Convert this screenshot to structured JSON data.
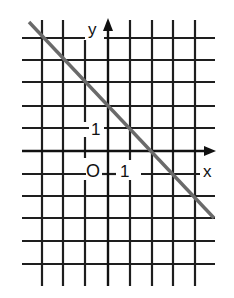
{
  "diagram": {
    "type": "coordinate-plane",
    "labels": {
      "x_axis": "x",
      "y_axis": "y",
      "origin": "O",
      "x_unit": "1",
      "y_unit": "1"
    },
    "grid": {
      "columns": 8,
      "rows": 11,
      "unit_px": 22
    },
    "line": {
      "equation": "y = -x + 2",
      "slope": -1,
      "y_intercept": 2,
      "x_intercept": 2,
      "color": "#6a6a6a"
    },
    "colors": {
      "grid": "#1e1e1e",
      "background": "#ffffff"
    }
  }
}
